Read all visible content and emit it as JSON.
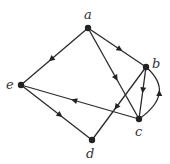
{
  "graph": {
    "type": "directed",
    "nodes": [
      {
        "id": "a",
        "label": "a",
        "x": 88,
        "y": 28,
        "lx": 84,
        "ly": 19
      },
      {
        "id": "b",
        "label": "b",
        "x": 146,
        "y": 67,
        "lx": 152,
        "ly": 68
      },
      {
        "id": "c",
        "label": "c",
        "x": 139,
        "y": 119,
        "lx": 135,
        "ly": 136
      },
      {
        "id": "d",
        "label": "d",
        "x": 92,
        "y": 140,
        "lx": 86,
        "ly": 158
      },
      {
        "id": "e",
        "label": "e",
        "x": 21,
        "y": 85,
        "lx": 6,
        "ly": 89
      }
    ],
    "edges": [
      {
        "from": "a",
        "to": "b"
      },
      {
        "from": "a",
        "to": "e"
      },
      {
        "from": "a",
        "to": "c"
      },
      {
        "from": "b",
        "to": "d"
      },
      {
        "from": "b",
        "to": "c"
      },
      {
        "from": "c",
        "to": "b",
        "curved": true
      },
      {
        "from": "c",
        "to": "e"
      },
      {
        "from": "e",
        "to": "d"
      }
    ]
  }
}
